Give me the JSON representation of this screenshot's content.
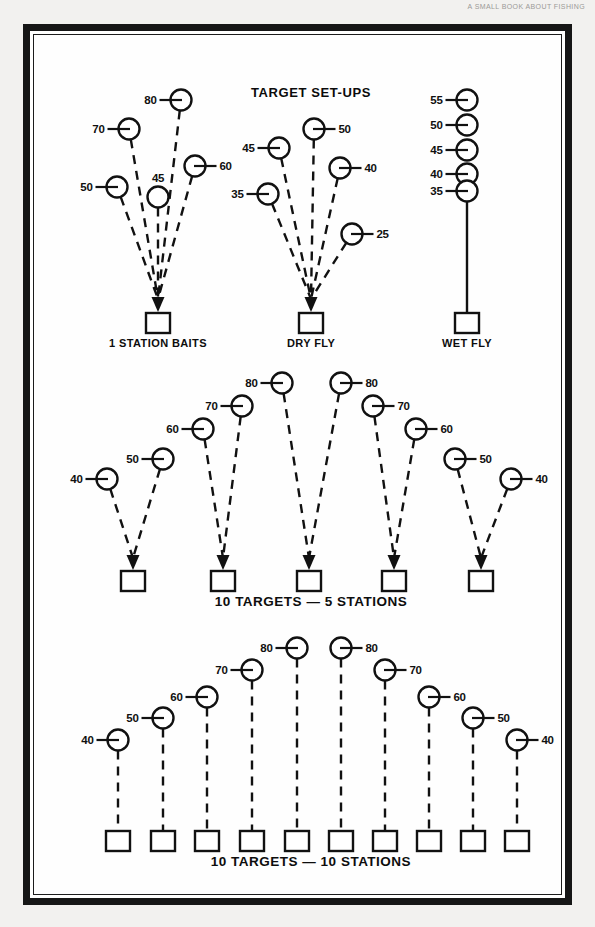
{
  "header": {
    "running_head": "A SMALL BOOK ABOUT FISHING"
  },
  "figure": {
    "title": "TARGET SET-UPS",
    "panels": [
      {
        "id": "one-station-baits",
        "label": "1 STATION BAITS",
        "style": "converging",
        "station": {
          "x": 147,
          "y": 312
        },
        "nodes": [
          {
            "value": "50",
            "cx": 106,
            "cy": 176,
            "label_side": "left"
          },
          {
            "value": "70",
            "cx": 118,
            "cy": 118,
            "label_side": "left"
          },
          {
            "value": "45",
            "cx": 147,
            "cy": 186,
            "label_side": "top"
          },
          {
            "value": "80",
            "cx": 170,
            "cy": 89,
            "label_side": "left"
          },
          {
            "value": "60",
            "cx": 184,
            "cy": 155,
            "label_side": "right"
          }
        ]
      },
      {
        "id": "dry-fly",
        "label": "DRY FLY",
        "style": "converging",
        "station": {
          "x": 300,
          "y": 312
        },
        "nodes": [
          {
            "value": "35",
            "cx": 257,
            "cy": 183,
            "label_side": "left"
          },
          {
            "value": "45",
            "cx": 268,
            "cy": 137,
            "label_side": "left"
          },
          {
            "value": "50",
            "cx": 303,
            "cy": 118,
            "label_side": "right"
          },
          {
            "value": "40",
            "cx": 329,
            "cy": 157,
            "label_side": "right"
          },
          {
            "value": "25",
            "cx": 341,
            "cy": 223,
            "label_side": "right"
          }
        ]
      },
      {
        "id": "wet-fly",
        "label": "WET FLY",
        "style": "stacked",
        "station": {
          "x": 456,
          "y": 312
        },
        "nodes": [
          {
            "value": "55",
            "cx": 456,
            "cy": 89,
            "label_side": "left"
          },
          {
            "value": "50",
            "cx": 456,
            "cy": 114,
            "label_side": "left"
          },
          {
            "value": "45",
            "cx": 456,
            "cy": 139,
            "label_side": "left"
          },
          {
            "value": "40",
            "cx": 456,
            "cy": 163,
            "label_side": "left"
          },
          {
            "value": "35",
            "cx": 456,
            "cy": 180,
            "label_side": "left"
          }
        ]
      }
    ],
    "rows": [
      {
        "id": "ten-targets-five-stations",
        "label": "10 TARGETS — 5 STATIONS",
        "label_x": 300,
        "label_y": 595,
        "stations": [
          {
            "x": 122,
            "y": 570
          },
          {
            "x": 212,
            "y": 570
          },
          {
            "x": 298,
            "y": 570
          },
          {
            "x": 383,
            "y": 570
          },
          {
            "x": 470,
            "y": 570
          }
        ],
        "nodes": [
          {
            "value": "40",
            "cx": 96,
            "cy": 468,
            "label_side": "left",
            "station": 0
          },
          {
            "value": "50",
            "cx": 152,
            "cy": 448,
            "label_side": "left",
            "station": 0
          },
          {
            "value": "60",
            "cx": 192,
            "cy": 418,
            "label_side": "left",
            "station": 1
          },
          {
            "value": "70",
            "cx": 231,
            "cy": 395,
            "label_side": "left",
            "station": 1
          },
          {
            "value": "80",
            "cx": 271,
            "cy": 372,
            "label_side": "left",
            "station": 2
          },
          {
            "value": "80",
            "cx": 330,
            "cy": 372,
            "label_side": "right",
            "station": 2
          },
          {
            "value": "70",
            "cx": 362,
            "cy": 395,
            "label_side": "right",
            "station": 3
          },
          {
            "value": "60",
            "cx": 405,
            "cy": 418,
            "label_side": "right",
            "station": 3
          },
          {
            "value": "50",
            "cx": 444,
            "cy": 448,
            "label_side": "right",
            "station": 4
          },
          {
            "value": "40",
            "cx": 500,
            "cy": 468,
            "label_side": "right",
            "station": 4
          }
        ]
      },
      {
        "id": "ten-targets-ten-stations",
        "label": "10 TARGETS — 10 STATIONS",
        "label_x": 300,
        "label_y": 855,
        "stations": [
          {
            "x": 107,
            "y": 830
          },
          {
            "x": 152,
            "y": 830
          },
          {
            "x": 196,
            "y": 830
          },
          {
            "x": 241,
            "y": 830
          },
          {
            "x": 286,
            "y": 830
          },
          {
            "x": 330,
            "y": 830
          },
          {
            "x": 374,
            "y": 830
          },
          {
            "x": 418,
            "y": 830
          },
          {
            "x": 462,
            "y": 830
          },
          {
            "x": 506,
            "y": 830
          }
        ],
        "nodes": [
          {
            "value": "40",
            "cx": 107,
            "cy": 729,
            "label_side": "left",
            "station": 0
          },
          {
            "value": "50",
            "cx": 152,
            "cy": 707,
            "label_side": "left",
            "station": 1
          },
          {
            "value": "60",
            "cx": 196,
            "cy": 686,
            "label_side": "left",
            "station": 2
          },
          {
            "value": "70",
            "cx": 241,
            "cy": 659,
            "label_side": "left",
            "station": 3
          },
          {
            "value": "80",
            "cx": 286,
            "cy": 637,
            "label_side": "left",
            "station": 4
          },
          {
            "value": "80",
            "cx": 330,
            "cy": 637,
            "label_side": "right",
            "station": 5
          },
          {
            "value": "70",
            "cx": 374,
            "cy": 659,
            "label_side": "right",
            "station": 6
          },
          {
            "value": "60",
            "cx": 418,
            "cy": 686,
            "label_side": "right",
            "station": 7
          },
          {
            "value": "50",
            "cx": 462,
            "cy": 707,
            "label_side": "right",
            "station": 8
          },
          {
            "value": "40",
            "cx": 506,
            "cy": 729,
            "label_side": "right",
            "station": 9
          }
        ]
      }
    ],
    "geometry": {
      "circle_r": 10.5,
      "square_w": 24,
      "square_h": 20,
      "tick_len": 11,
      "label_gap": 16
    },
    "colors": {
      "ink": "#111111",
      "paper": "#fefefe",
      "border": "#161616",
      "page_background": "#f2f1ef"
    }
  }
}
